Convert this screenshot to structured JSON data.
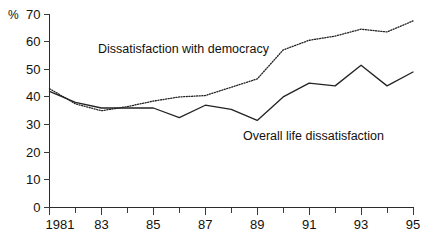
{
  "chart_data": {
    "type": "line",
    "title": "",
    "subtitle": "",
    "xlabel": "",
    "ylabel": "%",
    "ylim": [
      0,
      70
    ],
    "xlim": [
      1981,
      1995
    ],
    "grid": false,
    "legend_position": "inline-annotation",
    "y_ticks": [
      0,
      10,
      20,
      30,
      40,
      50,
      60,
      70
    ],
    "y_tick_labels": [
      "0",
      "10",
      "20",
      "30",
      "40",
      "50",
      "60",
      "70"
    ],
    "x_ticks": [
      1981,
      1982,
      1983,
      1984,
      1985,
      1986,
      1987,
      1988,
      1989,
      1990,
      1991,
      1992,
      1993,
      1994,
      1995
    ],
    "x_tick_labels": [
      "1981",
      "",
      "83",
      "",
      "85",
      "",
      "87",
      "",
      "89",
      "",
      "91",
      "",
      "93",
      "",
      "95"
    ],
    "x": [
      1981,
      1982,
      1983,
      1984,
      1985,
      1986,
      1987,
      1988,
      1989,
      1990,
      1991,
      1992,
      1993,
      1994,
      1995
    ],
    "series": [
      {
        "name": "Dissatisfaction with democracy",
        "style": "dotted",
        "color": "#232323",
        "values": [
          43,
          37.5,
          35,
          36.5,
          38.5,
          40,
          40.5,
          43.5,
          46.5,
          57,
          60.5,
          62,
          64.5,
          63.5,
          67.5
        ]
      },
      {
        "name": "Overall life dissatisfaction",
        "style": "solid",
        "color": "#232323",
        "values": [
          42,
          38,
          36,
          36,
          36,
          32.5,
          37,
          35.5,
          31.5,
          40,
          45,
          44,
          51.5,
          44,
          49
        ]
      }
    ],
    "annotations": [
      {
        "name": "democracy-label",
        "text": "Dissatisfaction with democracy",
        "x_px": 98,
        "y_px": 53
      },
      {
        "name": "life-label",
        "text": "Overall life dissatisfaction",
        "x_px": 243,
        "y_px": 140
      }
    ],
    "axis_unit_label": "%"
  }
}
